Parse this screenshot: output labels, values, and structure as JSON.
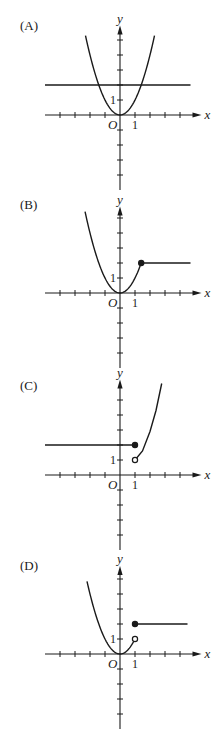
{
  "figure": {
    "panels": [
      {
        "label": "(A)",
        "origin_y": 115,
        "label_y": 26
      },
      {
        "label": "(B)",
        "origin_y": 293,
        "label_y": 205
      },
      {
        "label": "(C)",
        "origin_y": 475,
        "label_y": 386
      },
      {
        "label": "(D)",
        "origin_y": 654,
        "label_y": 566
      }
    ],
    "axis_labels": {
      "x": "x",
      "y": "y",
      "origin": "O",
      "unit": "1"
    },
    "colors": {
      "ink": "#1a1a1a",
      "background": "#ffffff"
    }
  },
  "chart_data": [
    {
      "type": "line",
      "title": "(A)",
      "xlabel": "x",
      "ylabel": "y",
      "xlim": [
        -5,
        5
      ],
      "ylim": [
        -5,
        5.7
      ],
      "grid": false,
      "tick_labels": {
        "x": [
          "1"
        ],
        "y": [
          "1"
        ],
        "origin": "O"
      },
      "series": [
        {
          "name": "parabola y = x^2",
          "domain": [
            -2.3,
            2.3
          ],
          "formula": "x^2"
        },
        {
          "name": "horizontal line y = 2",
          "domain": [
            -5,
            4.7
          ],
          "formula": "2"
        }
      ],
      "points": []
    },
    {
      "type": "line",
      "title": "(B)",
      "xlabel": "x",
      "ylabel": "y",
      "xlim": [
        -5,
        5
      ],
      "ylim": [
        -5,
        5.5
      ],
      "grid": false,
      "tick_labels": {
        "x": [
          "1"
        ],
        "y": [
          "1"
        ],
        "origin": "O"
      },
      "series": [
        {
          "name": "parabola y = x^2 (x ≤ √2)",
          "domain": [
            -2.33,
            1.414
          ],
          "formula": "x^2"
        },
        {
          "name": "horizontal line y = 2 (x > √2)",
          "domain": [
            1.414,
            4.7
          ],
          "formula": "2"
        }
      ],
      "points": [
        {
          "x": 1.414,
          "y": 2,
          "style": "closed"
        }
      ]
    },
    {
      "type": "line",
      "title": "(C)",
      "xlabel": "x",
      "ylabel": "y",
      "xlim": [
        -5,
        5
      ],
      "ylim": [
        -5,
        6.1
      ],
      "grid": false,
      "tick_labels": {
        "x": [
          "1"
        ],
        "y": [
          "1"
        ],
        "origin": "O"
      },
      "series": [
        {
          "name": "horizontal line y = 2 (x ≤ 1)",
          "domain": [
            -5,
            1
          ],
          "formula": "2"
        },
        {
          "name": "curve from (1,1) upward (x > 1)",
          "domain": [
            1,
            2.78
          ],
          "points": [
            [
              1,
              1
            ],
            [
              1.5,
              1.6
            ],
            [
              2,
              2.9
            ],
            [
              2.4,
              4.3
            ],
            [
              2.78,
              6.1
            ]
          ]
        }
      ],
      "points": [
        {
          "x": 1,
          "y": 2,
          "style": "closed"
        },
        {
          "x": 1,
          "y": 1,
          "style": "open"
        }
      ]
    },
    {
      "type": "line",
      "title": "(D)",
      "xlabel": "x",
      "ylabel": "y",
      "xlim": [
        -5,
        5
      ],
      "ylim": [
        -5,
        5.6
      ],
      "grid": false,
      "tick_labels": {
        "x": [
          "1"
        ],
        "y": [
          "1"
        ],
        "origin": "O"
      },
      "series": [
        {
          "name": "parabola y = x^2 (x < 1)",
          "domain": [
            -2.2,
            1
          ],
          "formula": "x^2"
        },
        {
          "name": "horizontal line y = 2 (x ≥ 1)",
          "domain": [
            1,
            4.5
          ],
          "formula": "2"
        }
      ],
      "points": [
        {
          "x": 1,
          "y": 1,
          "style": "open"
        },
        {
          "x": 1,
          "y": 2,
          "style": "closed"
        }
      ]
    }
  ]
}
